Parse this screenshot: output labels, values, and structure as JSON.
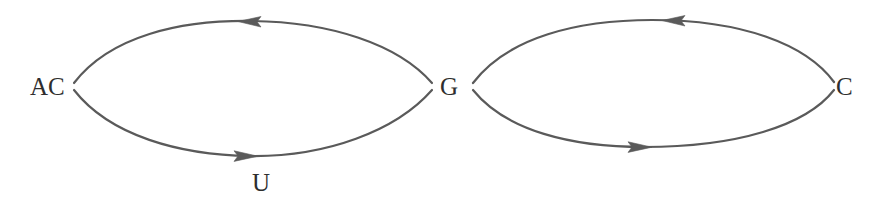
{
  "diagram": {
    "type": "directed-multigraph",
    "background_color": "#ffffff",
    "stroke_color": "#5a5a5a",
    "text_color": "#2e2e2e",
    "stroke_width": 2.2,
    "nodes": [
      {
        "id": "AC",
        "label": "AC",
        "x": 72,
        "y": 86
      },
      {
        "id": "G",
        "label": "G",
        "x": 452,
        "y": 86
      },
      {
        "id": "C",
        "label": "C",
        "x": 844,
        "y": 86
      }
    ],
    "edges": [
      {
        "id": "edge-g-to-ac",
        "from": "G",
        "to": "AC",
        "label": "",
        "side": "top",
        "arrow_direction": "left",
        "arrow_x": 252,
        "arrow_y": 22
      },
      {
        "id": "edge-ac-to-g",
        "from": "AC",
        "to": "G",
        "label": "U",
        "side": "bottom",
        "arrow_direction": "right",
        "arrow_x": 248,
        "arrow_y": 156
      },
      {
        "id": "edge-c-to-g",
        "from": "C",
        "to": "G",
        "label": "",
        "side": "top",
        "arrow_direction": "left",
        "arrow_x": 676,
        "arrow_y": 21
      },
      {
        "id": "edge-g-to-c",
        "from": "G",
        "to": "C",
        "label": "",
        "side": "bottom",
        "arrow_direction": "right",
        "arrow_x": 642,
        "arrow_y": 147
      }
    ],
    "node_labels": {
      "ac": "AC",
      "g": "G",
      "c": "C"
    },
    "edge_labels": {
      "u": "U"
    }
  }
}
